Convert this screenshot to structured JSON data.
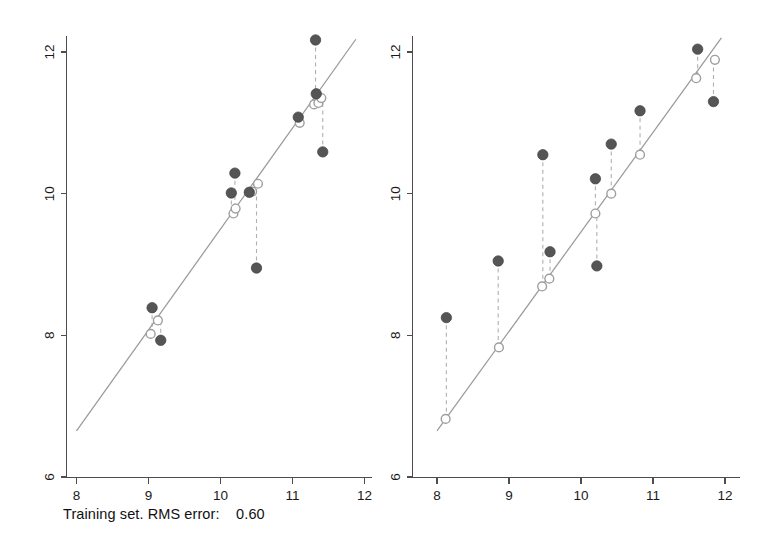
{
  "figure": {
    "background_color": "#ffffff",
    "panel_count": 2
  },
  "panels": [
    {
      "id": "training",
      "caption": "Training set. RMS error:    0.60",
      "caption_prefix": "Training set. RMS error:",
      "rms_error": "0.60",
      "x_tick_labels": [
        "8",
        "9",
        "10",
        "11",
        "12"
      ],
      "y_tick_labels": [
        "6",
        "8",
        "10",
        "12"
      ]
    },
    {
      "id": "test",
      "caption": "Test set. RMS error:    0.96",
      "caption_prefix": "Test set. RMS error:",
      "rms_error": "0.96",
      "x_tick_labels": [
        "8",
        "9",
        "10",
        "11",
        "12"
      ],
      "y_tick_labels": [
        "6",
        "8",
        "10",
        "12"
      ]
    }
  ],
  "chart_data": [
    {
      "type": "scatter",
      "id": "training-set-scatter",
      "title": "Training set. RMS error:    0.60",
      "xlabel": "",
      "ylabel": "",
      "xlim": [
        8,
        12
      ],
      "ylim": [
        6,
        12
      ],
      "xticks": [
        8,
        9,
        10,
        11,
        12
      ],
      "yticks": [
        6,
        8,
        10,
        12
      ],
      "grid": false,
      "legend": "none",
      "series": [
        {
          "name": "observed",
          "marker": "filled-circle",
          "color": "#555555",
          "points": [
            {
              "x": 9.05,
              "y": 8.39
            },
            {
              "x": 9.17,
              "y": 7.93
            },
            {
              "x": 10.2,
              "y": 10.29
            },
            {
              "x": 10.15,
              "y": 10.01
            },
            {
              "x": 10.4,
              "y": 10.02
            },
            {
              "x": 10.5,
              "y": 8.95
            },
            {
              "x": 11.08,
              "y": 11.08
            },
            {
              "x": 11.33,
              "y": 11.41
            },
            {
              "x": 11.32,
              "y": 12.17
            },
            {
              "x": 11.42,
              "y": 10.59
            }
          ]
        },
        {
          "name": "predicted",
          "marker": "open-circle",
          "color": "#9e9e9e",
          "points": [
            {
              "x": 9.03,
              "y": 8.02
            },
            {
              "x": 9.13,
              "y": 8.21
            },
            {
              "x": 10.18,
              "y": 9.72
            },
            {
              "x": 10.21,
              "y": 9.79
            },
            {
              "x": 10.44,
              "y": 10.03
            },
            {
              "x": 10.52,
              "y": 10.14
            },
            {
              "x": 11.1,
              "y": 11.0
            },
            {
              "x": 11.3,
              "y": 11.26
            },
            {
              "x": 11.36,
              "y": 11.28
            },
            {
              "x": 11.4,
              "y": 11.35
            }
          ]
        }
      ],
      "residual_pairs": [
        {
          "x": 9.05,
          "y_observed": 8.39,
          "y_predicted": 8.02
        },
        {
          "x": 9.17,
          "y_observed": 7.93,
          "y_predicted": 8.21
        },
        {
          "x": 10.2,
          "y_observed": 10.29,
          "y_predicted": 9.79
        },
        {
          "x": 10.15,
          "y_observed": 10.01,
          "y_predicted": 9.72
        },
        {
          "x": 10.4,
          "y_observed": 10.02,
          "y_predicted": 10.03
        },
        {
          "x": 10.5,
          "y_observed": 8.95,
          "y_predicted": 10.14
        },
        {
          "x": 11.08,
          "y_observed": 11.08,
          "y_predicted": 11.0
        },
        {
          "x": 11.33,
          "y_observed": 11.41,
          "y_predicted": 11.26
        },
        {
          "x": 11.32,
          "y_observed": 12.17,
          "y_predicted": 11.28
        },
        {
          "x": 11.42,
          "y_observed": 10.59,
          "y_predicted": 11.35
        }
      ],
      "fit_line": {
        "x0": 8.0,
        "y0": 6.65,
        "x1": 11.88,
        "y1": 12.18,
        "color": "#9a9a9a"
      }
    },
    {
      "type": "scatter",
      "id": "test-set-scatter",
      "title": "Test set. RMS error:    0.96",
      "xlabel": "",
      "ylabel": "",
      "xlim": [
        8,
        12
      ],
      "ylim": [
        6,
        12
      ],
      "xticks": [
        8,
        9,
        10,
        11,
        12
      ],
      "yticks": [
        6,
        8,
        10,
        12
      ],
      "grid": false,
      "legend": "none",
      "series": [
        {
          "name": "observed",
          "marker": "filled-circle",
          "color": "#555555",
          "points": [
            {
              "x": 8.13,
              "y": 8.25
            },
            {
              "x": 8.85,
              "y": 9.05
            },
            {
              "x": 9.47,
              "y": 10.55
            },
            {
              "x": 9.57,
              "y": 9.18
            },
            {
              "x": 10.2,
              "y": 10.21
            },
            {
              "x": 10.22,
              "y": 8.98
            },
            {
              "x": 10.42,
              "y": 10.7
            },
            {
              "x": 10.82,
              "y": 11.17
            },
            {
              "x": 11.62,
              "y": 12.04
            },
            {
              "x": 11.84,
              "y": 11.3
            }
          ]
        },
        {
          "name": "predicted",
          "marker": "open-circle",
          "color": "#9e9e9e",
          "points": [
            {
              "x": 8.12,
              "y": 6.82
            },
            {
              "x": 8.86,
              "y": 7.83
            },
            {
              "x": 9.46,
              "y": 8.69
            },
            {
              "x": 9.56,
              "y": 8.8
            },
            {
              "x": 10.2,
              "y": 9.72
            },
            {
              "x": 10.42,
              "y": 10.0
            },
            {
              "x": 10.82,
              "y": 10.55
            },
            {
              "x": 11.6,
              "y": 11.63
            },
            {
              "x": 11.86,
              "y": 11.89
            }
          ]
        }
      ],
      "residual_pairs": [
        {
          "x": 8.13,
          "y_observed": 8.25,
          "y_predicted": 6.82
        },
        {
          "x": 8.85,
          "y_observed": 9.05,
          "y_predicted": 7.83
        },
        {
          "x": 9.47,
          "y_observed": 10.55,
          "y_predicted": 8.69
        },
        {
          "x": 9.57,
          "y_observed": 9.18,
          "y_predicted": 8.8
        },
        {
          "x": 10.2,
          "y_observed": 10.21,
          "y_predicted": 9.72
        },
        {
          "x": 10.22,
          "y_observed": 8.98,
          "y_predicted": 9.72
        },
        {
          "x": 10.42,
          "y_observed": 10.7,
          "y_predicted": 10.0
        },
        {
          "x": 10.82,
          "y_observed": 11.17,
          "y_predicted": 10.55
        },
        {
          "x": 11.62,
          "y_observed": 12.04,
          "y_predicted": 11.63
        },
        {
          "x": 11.84,
          "y_observed": 11.3,
          "y_predicted": 11.89
        }
      ],
      "fit_line": {
        "x0": 8.0,
        "y0": 6.65,
        "x1": 11.95,
        "y1": 12.2,
        "color": "#9a9a9a"
      }
    }
  ]
}
